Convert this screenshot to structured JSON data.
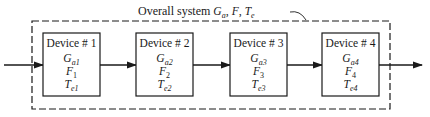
{
  "title": {
    "prefix": "Overall system ",
    "symbols": [
      {
        "base": "G",
        "sub": "a"
      },
      {
        "base": "F",
        "sub": ""
      },
      {
        "base": "T",
        "sub": "e"
      }
    ],
    "separator": ", "
  },
  "devices": [
    {
      "label": "Device # 1",
      "gain": {
        "base": "G",
        "sub": "a1"
      },
      "noise_figure": {
        "base": "F",
        "sub": "1"
      },
      "temperature": {
        "base": "T",
        "sub": "e1"
      }
    },
    {
      "label": "Device # 2",
      "gain": {
        "base": "G",
        "sub": "a2"
      },
      "noise_figure": {
        "base": "F",
        "sub": "2"
      },
      "temperature": {
        "base": "T",
        "sub": "e2"
      }
    },
    {
      "label": "Device # 3",
      "gain": {
        "base": "G",
        "sub": "a3"
      },
      "noise_figure": {
        "base": "F",
        "sub": "3"
      },
      "temperature": {
        "base": "T",
        "sub": "e3"
      }
    },
    {
      "label": "Device # 4",
      "gain": {
        "base": "G",
        "sub": "a4"
      },
      "noise_figure": {
        "base": "F",
        "sub": "4"
      },
      "temperature": {
        "base": "T",
        "sub": "e4"
      }
    }
  ],
  "colors": {
    "stroke": "#1a1a1a",
    "background": "#ffffff"
  }
}
